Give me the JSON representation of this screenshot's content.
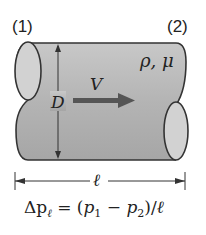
{
  "diagram": {
    "section_labels": [
      "(1)",
      "(2)"
    ],
    "properties_label": "ρ, μ",
    "velocity_label": "V",
    "diameter_label": "D",
    "length_label": "ℓ",
    "equation": {
      "lhs": "Δp",
      "lhs_sub": "ℓ",
      "eq": " = (",
      "p1": "p",
      "p1_sub": "1",
      "minus": " − ",
      "p2": "p",
      "p2_sub": "2",
      "close": ")/",
      "ell": "ℓ"
    },
    "colors": {
      "pipe_fill": "#b8b8b8",
      "pipe_end_fill": "#d4d4d4",
      "stroke": "#333333",
      "arrow": "#555555"
    }
  }
}
